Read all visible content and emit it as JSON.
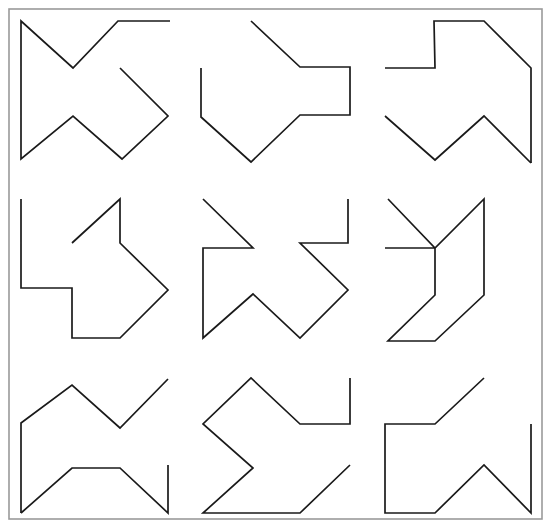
{
  "canvas": {
    "width": 551,
    "height": 528,
    "background_color": "#ffffff",
    "stroke_color": "#1a1a1a",
    "frame_color": "#9a9a9a",
    "stroke_width": 1.7,
    "frame_stroke_width": 1.6
  },
  "frame": {
    "x": 9,
    "y": 9,
    "width": 533,
    "height": 510
  },
  "chart_data": {
    "type": "line",
    "title": "",
    "xlabel": "",
    "ylabel": "",
    "grid": false,
    "legend": "none",
    "xlim": [
      0,
      551
    ],
    "ylim": [
      0,
      528
    ],
    "rows": 3,
    "columns": 3,
    "series": [
      {
        "name": "cell-r1c1",
        "row": 1,
        "column": 1,
        "closed": false,
        "points": [
          [
            170,
            21
          ],
          [
            118,
            21
          ],
          [
            73,
            68
          ],
          [
            21,
            21
          ],
          [
            21,
            159
          ],
          [
            73,
            116
          ],
          [
            122,
            159
          ],
          [
            168,
            116
          ],
          [
            120,
            68
          ]
        ]
      },
      {
        "name": "cell-r1c2",
        "row": 1,
        "column": 2,
        "closed": false,
        "points": [
          [
            251,
            21
          ],
          [
            300,
            67
          ],
          [
            350,
            67
          ],
          [
            350,
            115
          ],
          [
            300,
            115
          ],
          [
            251,
            162
          ],
          [
            201,
            117
          ],
          [
            201,
            68
          ]
        ]
      },
      {
        "name": "cell-r1c3-upper",
        "row": 1,
        "column": 3,
        "closed": false,
        "points": [
          [
            385,
            68
          ],
          [
            435,
            68
          ],
          [
            434,
            21
          ],
          [
            484,
            21
          ],
          [
            531,
            68
          ],
          [
            531,
            120
          ]
        ]
      },
      {
        "name": "cell-r1c3-lower",
        "row": 1,
        "column": 3,
        "closed": false,
        "points": [
          [
            385,
            116
          ],
          [
            435,
            160
          ],
          [
            484,
            116
          ],
          [
            531,
            162
          ]
        ]
      },
      {
        "name": "cell-r2c1",
        "row": 2,
        "column": 1,
        "closed": false,
        "points": [
          [
            21,
            199
          ],
          [
            21,
            288
          ],
          [
            72,
            288
          ],
          [
            72,
            338
          ],
          [
            120,
            338
          ],
          [
            168,
            290
          ],
          [
            120,
            243
          ],
          [
            120,
            199
          ],
          [
            72,
            243
          ]
        ]
      },
      {
        "name": "cell-r2c2",
        "row": 2,
        "column": 2,
        "closed": false,
        "points": [
          [
            203,
            199
          ],
          [
            253,
            248
          ],
          [
            203,
            248
          ],
          [
            203,
            338
          ],
          [
            253,
            294
          ],
          [
            300,
            338
          ],
          [
            348,
            290
          ],
          [
            300,
            243
          ],
          [
            348,
            243
          ],
          [
            348,
            199
          ]
        ]
      },
      {
        "name": "cell-r2c3",
        "row": 2,
        "column": 3,
        "closed": false,
        "points": [
          [
            385,
            248
          ],
          [
            435,
            248
          ],
          [
            435,
            295
          ],
          [
            388,
            341
          ],
          [
            435,
            341
          ],
          [
            484,
            295
          ],
          [
            484,
            199
          ],
          [
            435,
            248
          ],
          [
            388,
            199
          ]
        ]
      },
      {
        "name": "cell-r3c1",
        "row": 3,
        "column": 1,
        "closed": false,
        "points": [
          [
            21,
            420
          ],
          [
            21,
            385
          ],
          [
            72,
            385
          ],
          [
            120,
            428
          ],
          [
            168,
            385
          ],
          [
            168,
            430
          ]
        ]
      },
      {
        "name": "cell-r3c2",
        "row": 3,
        "column": 2,
        "closed": false,
        "points": [
          [
            203,
            430
          ],
          [
            251,
            385
          ],
          [
            300,
            428
          ],
          [
            348,
            385
          ],
          [
            348,
            430
          ]
        ]
      },
      {
        "name": "cell-r3c3",
        "row": 3,
        "column": 3,
        "closed": false,
        "points": [
          [
            385,
            430
          ],
          [
            435,
            385
          ],
          [
            484,
            428
          ],
          [
            531,
            385
          ],
          [
            531,
            430
          ]
        ]
      }
    ],
    "paths": [
      "M 170 21 L 118 21 L 73 68 L 21 21 L 21 159 L 73 116 L 122 159 L 168 116 L 120 68",
      "M 251 21 L 300 67 L 350 67 L 350 115 L 300 115 L 251 162 L 201 117 L 201 68",
      "M 385 68 L 435 68 L 434 21 L 484 21 L 531 68 L 531 162",
      "M 385 116 L 435 160 L 484 116 L 531 162",
      "M 21 199 L 21 288 L 72 288 L 72 338 L 120 338 L 168 290 L 120 243 L 120 199 L 72 243",
      "M 203 199 L 253 248 L 203 248 L 203 338 L 253 294 L 300 338 L 348 290 L 300 243 L 348 243 L 348 199",
      "M 385 248 L 435 248 L 435 295 L 388 341 L 435 341 L 484 295 L 484 199 L 435 248 L 388 199",
      "M 21 430 L 21 385 L 72 385 L 120 428 L 168 385",
      "M 21 430 L 72 470 L 120 470 L 168 430",
      "M 203 430 L 251 385 L 300 428 L 348 385",
      "M 385 430 L 435 385 L 484 428 L 531 385"
    ]
  },
  "figures": [
    {
      "id": "figure-r1c1",
      "name": "zigzag-glyph-top-left",
      "row": 1,
      "column": 1,
      "stroke_count": 1,
      "d": "M 170 21 L 118 21 L 73 68 L 21 21 L 21 159 L 73 116 L 122 159 L 168 116 L 120 68"
    },
    {
      "id": "figure-r1c2",
      "name": "arrow-notch-glyph-top-center",
      "row": 1,
      "column": 2,
      "stroke_count": 1,
      "d": "M 251 21 L 300 67 L 350 67 L 350 115 L 300 115 L 251 162 L 201 117 L 201 68"
    },
    {
      "id": "figure-r1c3-a",
      "name": "stepped-glyph-top-right-upper",
      "row": 1,
      "column": 3,
      "stroke_count": 2,
      "d": "M 385 68 L 435 68 L 434 21 L 484 21 L 531 68 L 531 163"
    },
    {
      "id": "figure-r1c3-b",
      "name": "zigzag-glyph-top-right-lower",
      "row": 1,
      "column": 3,
      "stroke_count": 2,
      "d": "M 385 116 L 435 160 L 484 116 L 531 163"
    },
    {
      "id": "figure-r2c1",
      "name": "hooked-glyph-middle-left",
      "row": 2,
      "column": 1,
      "stroke_count": 1,
      "d": "M 21 199 L 21 288 L 72 288 L 72 338 L 120 338 L 168 290 L 120 243 L 120 199 L 72 243"
    },
    {
      "id": "figure-r2c2",
      "name": "star-burst-glyph-middle-center",
      "row": 2,
      "column": 2,
      "stroke_count": 1,
      "d": "M 203 199 L 253 248 L 203 248 L 203 338 L 253 294 L 300 338 L 348 290 L 300 243 L 348 243 L 348 199"
    },
    {
      "id": "figure-r2c3",
      "name": "double-hook-glyph-middle-right",
      "row": 2,
      "column": 3,
      "stroke_count": 1,
      "d": "M 388 199 L 435 248 L 484 199 L 484 295 L 435 341 L 388 341 L 435 295 L 435 248 L 385 248"
    },
    {
      "id": "figure-r3c1-a",
      "name": "chevron-glyph-bottom-left-upper",
      "row": 3,
      "column": 1,
      "stroke_count": 2,
      "d": "M 168 379 L 120 428 L 72 385 L 21 423 L 21 513"
    },
    {
      "id": "figure-r3c1-b",
      "name": "chevron-glyph-bottom-left-lower",
      "row": 3,
      "column": 1,
      "stroke_count": 2,
      "d": "M 21 513 L 72 468 L 120 468 L 168 513 L 168 465"
    },
    {
      "id": "figure-r3c2",
      "name": "zigzag-arrow-glyph-bottom-center",
      "row": 3,
      "column": 2,
      "stroke_count": 1,
      "d": "M 350 378 L 350 424 L 300 424 L 251 378 L 203 424 L 253 468 L 203 513 L 300 513 L 350 465"
    },
    {
      "id": "figure-r3c3",
      "name": "block-arrow-glyph-bottom-right",
      "row": 3,
      "column": 3,
      "stroke_count": 1,
      "d": "M 484 378 L 435 424 L 385 424 L 385 513 L 435 513 L 484 465 L 531 513 L 531 424"
    }
  ]
}
